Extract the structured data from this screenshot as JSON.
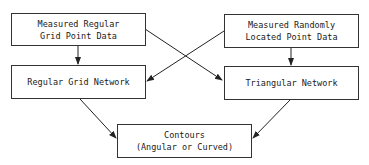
{
  "diagram": {
    "nodes": [
      {
        "id": "measured-regular",
        "lines": [
          "Measured Regular",
          "Grid Point Data"
        ]
      },
      {
        "id": "measured-random",
        "lines": [
          "Measured Randomly",
          "Located Point Data"
        ]
      },
      {
        "id": "regular-grid-network",
        "lines": [
          "Regular Grid Network"
        ]
      },
      {
        "id": "triangular-network",
        "lines": [
          "Triangular Network"
        ]
      },
      {
        "id": "contours",
        "lines": [
          "Contours",
          "(Angular or Curved)"
        ]
      }
    ],
    "edges": [
      {
        "from": "measured-regular",
        "to": "regular-grid-network"
      },
      {
        "from": "measured-regular",
        "to": "triangular-network"
      },
      {
        "from": "measured-random",
        "to": "regular-grid-network"
      },
      {
        "from": "measured-random",
        "to": "triangular-network"
      },
      {
        "from": "regular-grid-network",
        "to": "contours"
      },
      {
        "from": "triangular-network",
        "to": "contours"
      }
    ]
  }
}
